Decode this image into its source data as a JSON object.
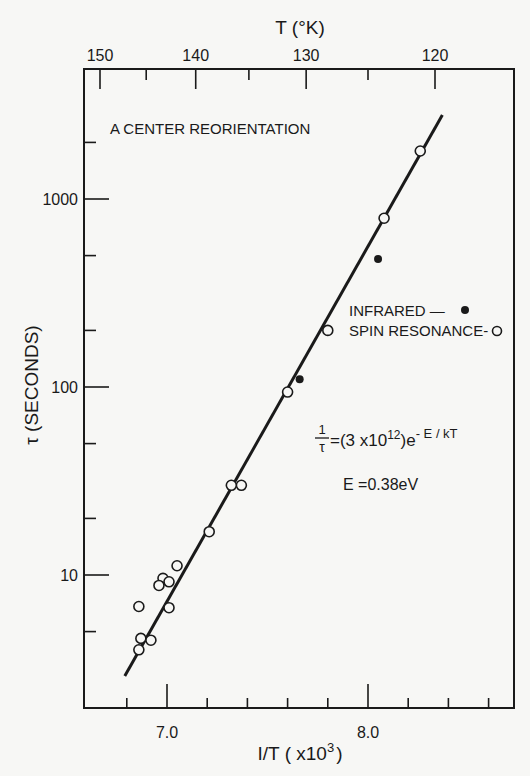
{
  "chart_data": {
    "type": "scatter",
    "title": "A CENTER REORIENTATION",
    "xlabel": "1/T (x10^3)",
    "xlabel_parts": {
      "base": "I/T ( x10",
      "sup": "3",
      "close": ")"
    },
    "ylabel": "τ (SECONDS)",
    "top_xlabel": "T (°K)",
    "yscale": "log",
    "xlim": [
      6.58,
      8.72
    ],
    "ylim": [
      2.5,
      5000
    ],
    "x_ticks_major": [
      {
        "value": 7.0,
        "label": "7.0"
      },
      {
        "value": 8.0,
        "label": "8.0"
      }
    ],
    "x_ticks_minor": [
      6.8,
      7.2,
      7.4,
      7.6,
      7.8,
      8.2,
      8.4,
      8.6
    ],
    "y_ticks_major": [
      {
        "value": 10,
        "label": "10"
      },
      {
        "value": 100,
        "label": "100"
      },
      {
        "value": 1000,
        "label": "1000"
      }
    ],
    "y_ticks_minor": [
      5,
      20,
      50,
      200,
      500,
      2000
    ],
    "top_ticks_major": [
      {
        "value": 150,
        "label": "150"
      },
      {
        "value": 140,
        "label": "140"
      },
      {
        "value": 130,
        "label": "130"
      },
      {
        "value": 120,
        "label": "120"
      }
    ],
    "top_ticks_minor": [
      145,
      135,
      125
    ],
    "grid": false,
    "series": [
      {
        "name": "SPIN RESONANCE",
        "marker": "open-circle",
        "points": [
          {
            "x": 8.26,
            "y": 1800
          },
          {
            "x": 8.08,
            "y": 790
          },
          {
            "x": 7.8,
            "y": 200
          },
          {
            "x": 7.6,
            "y": 94
          },
          {
            "x": 7.37,
            "y": 30
          },
          {
            "x": 7.32,
            "y": 30
          },
          {
            "x": 7.21,
            "y": 17
          },
          {
            "x": 7.05,
            "y": 11.2
          },
          {
            "x": 6.98,
            "y": 9.6
          },
          {
            "x": 7.01,
            "y": 9.2
          },
          {
            "x": 6.96,
            "y": 8.8
          },
          {
            "x": 6.86,
            "y": 6.8
          },
          {
            "x": 7.01,
            "y": 6.7
          },
          {
            "x": 6.87,
            "y": 4.6
          },
          {
            "x": 6.92,
            "y": 4.5
          },
          {
            "x": 6.86,
            "y": 4.0
          }
        ]
      },
      {
        "name": "INFRARED",
        "marker": "filled-circle",
        "points": [
          {
            "x": 8.05,
            "y": 480
          },
          {
            "x": 7.66,
            "y": 110
          }
        ]
      },
      {
        "name": "fit",
        "type": "line",
        "points": [
          {
            "x": 6.79,
            "y": 2.9
          },
          {
            "x": 8.37,
            "y": 2800
          }
        ]
      }
    ],
    "legend": [
      {
        "label": "INFRARED —",
        "marker": "filled-circle"
      },
      {
        "label": "SPIN RESONANCE-",
        "marker": "open-circle"
      }
    ],
    "annotations": {
      "equation_lhs_num": "1",
      "equation_lhs_den": "τ",
      "equation_rhs": "=(3 x10",
      "equation_rhs_exp": "12",
      "equation_rhs_tail": ")e",
      "equation_rhs_tail_exp": "- E / kT",
      "energy": "E =0.38eV"
    }
  }
}
